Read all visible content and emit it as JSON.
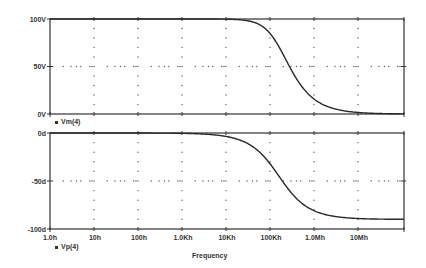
{
  "chart_data": [
    {
      "type": "line",
      "title": "",
      "series": [
        {
          "name": "Vm(4)",
          "x": [
            "1.0h",
            "10h",
            "100h",
            "1.0Kh",
            "10Kh",
            "100Kh",
            "160Kh",
            "300Kh",
            "1.0Mh",
            "10Mh",
            "100Mh"
          ],
          "values": [
            100,
            100,
            100,
            100,
            99.9,
            85,
            71,
            47,
            16,
            1.6,
            0.2
          ]
        }
      ],
      "xlabel": "",
      "ylabel": "",
      "yticks": [
        "0V",
        "50V",
        "100V"
      ],
      "ylim": [
        0,
        100
      ],
      "xscale": "log",
      "xlim": [
        "1.0h",
        "100Mh"
      ],
      "grid": true,
      "legend": "below-left"
    },
    {
      "type": "line",
      "title": "",
      "series": [
        {
          "name": "Vp(4)",
          "x": [
            "1.0h",
            "10h",
            "100h",
            "1.0Kh",
            "10Kh",
            "100Kh",
            "160Kh",
            "300Kh",
            "1.0Mh",
            "10Mh",
            "100Mh"
          ],
          "values": [
            0,
            0,
            0,
            -0.4,
            -3.6,
            -32,
            -45,
            -62,
            -81,
            -88.5,
            -89.9
          ]
        }
      ],
      "xlabel": "Frequency",
      "ylabel": "",
      "yticks": [
        "-100d",
        "-50d",
        "0d"
      ],
      "ylim": [
        -100,
        0
      ],
      "xscale": "log",
      "xticks": [
        "1.0h",
        "10h",
        "100h",
        "1.0Kh",
        "10Kh",
        "100Kh",
        "1.0Mh",
        "10Mh"
      ],
      "grid": true,
      "legend": "below-left"
    }
  ],
  "top_panel": {
    "ytick_labels": [
      "100V",
      "50V",
      "0V"
    ],
    "legend_label": "Vm(4)"
  },
  "bottom_panel": {
    "ytick_labels": [
      "0d",
      "-50d",
      "-100d"
    ],
    "legend_label": "Vp(4)"
  },
  "x_axis": {
    "tick_labels": [
      "1.0h",
      "10h",
      "100h",
      "1.0Kh",
      "10Kh",
      "100Kh",
      "1.0Mh",
      "10Mh"
    ],
    "title": "Frequency"
  },
  "colors": {
    "axis": "#333333",
    "curve": "#2a2a2a",
    "grid": "#555555"
  }
}
